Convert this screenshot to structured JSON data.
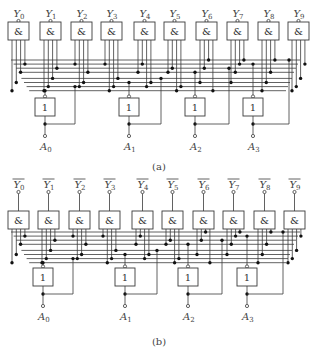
{
  "figure": {
    "panels": [
      {
        "id": "a",
        "caption": "(a)",
        "output_prefix": "Y",
        "outputs_inverted": false,
        "outputs": [
          "0",
          "1",
          "2",
          "3",
          "4",
          "5",
          "6",
          "7",
          "8",
          "9"
        ],
        "gate_symbol": "&",
        "inputs": [
          "0",
          "1",
          "2",
          "3"
        ],
        "input_prefix": "A",
        "inverter_symbol": "1"
      },
      {
        "id": "b",
        "caption": "(b)",
        "output_prefix": "Y",
        "outputs_inverted": true,
        "outputs": [
          "0",
          "1",
          "2",
          "3",
          "4",
          "5",
          "6",
          "7",
          "8",
          "9"
        ],
        "gate_symbol": "&",
        "inputs": [
          "0",
          "1",
          "2",
          "3"
        ],
        "input_prefix": "A",
        "inverter_symbol": "1"
      }
    ]
  }
}
